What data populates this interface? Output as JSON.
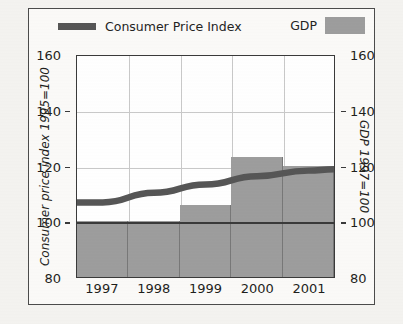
{
  "legend": {
    "cpi_label": "Consumer Price Index",
    "gdp_label": "GDP",
    "line_color": "#565656",
    "bar_color": "#9d9d9d"
  },
  "axes": {
    "left_title": "Consumer price index 1995=100",
    "right_title": "GDP 1997=100",
    "ticks": [
      "160",
      "140",
      "120",
      "100",
      "80"
    ]
  },
  "chart_data": {
    "type": "bar",
    "title": "",
    "subtitle": "",
    "xlabel": "",
    "ylabel": "Consumer price index 1995=100",
    "y2label": "GDP 1997=100",
    "categories": [
      "1997",
      "1998",
      "1999",
      "2000",
      "2001"
    ],
    "ylim": [
      80,
      160
    ],
    "y2lim": [
      80,
      160
    ],
    "yticks": [
      80,
      100,
      120,
      140,
      160
    ],
    "grid": true,
    "legend_position": "top",
    "series": [
      {
        "name": "GDP",
        "type": "bar",
        "axis": "right",
        "color": "#9d9d9d",
        "values": [
          100,
          100,
          106,
          123,
          120
        ]
      },
      {
        "name": "Consumer Price Index",
        "type": "line",
        "axis": "left",
        "color": "#565656",
        "x": [
          "1997",
          "1998",
          "1999",
          "2000",
          "2001"
        ],
        "values": [
          107,
          110.5,
          113.5,
          116.5,
          118.5
        ],
        "start_value": 107,
        "end_value": 119
      }
    ]
  }
}
